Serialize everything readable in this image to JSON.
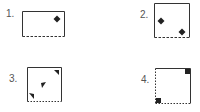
{
  "figures": [
    {
      "label": "1.",
      "shape": "rectangle",
      "solid_sides": [
        "top",
        "left",
        "right"
      ],
      "dashed_sides": [
        "bottom"
      ],
      "markers": [
        "diamond"
      ]
    },
    {
      "label": "2.",
      "shape": "square",
      "solid_sides": [
        "top",
        "left",
        "right"
      ],
      "dashed_sides": [
        "bottom"
      ],
      "markers": [
        "diamond",
        "diamond"
      ]
    },
    {
      "label": "3.",
      "shape": "square",
      "solid_sides": [
        "top",
        "left",
        "right"
      ],
      "dashed_sides": [
        "bottom"
      ],
      "markers": [
        "triangle-top-right",
        "triangle-center",
        "triangle-bottom-left"
      ]
    },
    {
      "label": "4.",
      "shape": "square",
      "solid_sides": [
        "top",
        "right"
      ],
      "dashed_sides": [
        "left",
        "bottom"
      ],
      "markers": [
        "square-top-right",
        "square-bottom-left"
      ]
    }
  ],
  "colors": {
    "stroke": "#333333",
    "fill": "#222222",
    "label": "#555555"
  }
}
